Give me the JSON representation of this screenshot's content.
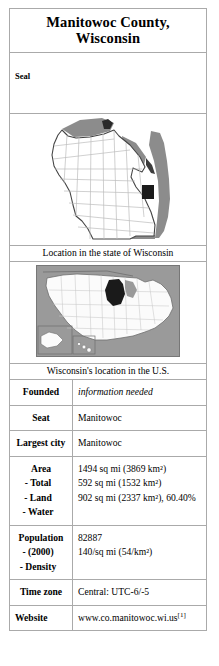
{
  "infobox": {
    "title": "Manitowoc County, Wisconsin",
    "title_line1": "Manitowoc County,",
    "title_line2": "Wisconsin",
    "seal_label": "Seal",
    "state_map": {
      "caption": "Location in the state of Wisconsin",
      "highlight_color": "#1a1a1a",
      "water_color": "#8c8c8c",
      "land_color": "#ffffff",
      "border_color": "#555555"
    },
    "us_map": {
      "caption": "Wisconsin's location in the U.S.",
      "highlight_color": "#1a1a1a",
      "surround_color": "#9a9a9a",
      "land_color": "#fbfbfb",
      "border_color": "#777777"
    },
    "rows": [
      {
        "label": "Founded",
        "value": "information needed",
        "italic": true
      },
      {
        "label": "Seat",
        "value": "Manitowoc",
        "italic": false
      },
      {
        "label": "Largest city",
        "value": "Manitowoc",
        "italic": false
      }
    ],
    "area": {
      "label": "Area",
      "sublabels": [
        "- Total",
        "- Land",
        "- Water"
      ],
      "values": [
        "1494 sq mi (3869 km²)",
        "592 sq mi (1532 km²)",
        "902 sq mi (2337 km²), 60.40%"
      ]
    },
    "population": {
      "label": "Population",
      "sublabels": [
        "- (2000)",
        "- Density"
      ],
      "values": [
        "82887",
        "140/sq mi (54/km²)"
      ]
    },
    "timezone": {
      "label": "Time zone",
      "value": "Central: UTC-6/-5"
    },
    "website": {
      "label": "Website",
      "value": "www.co.manitowoc.wi.us",
      "reference": "[1]"
    }
  }
}
